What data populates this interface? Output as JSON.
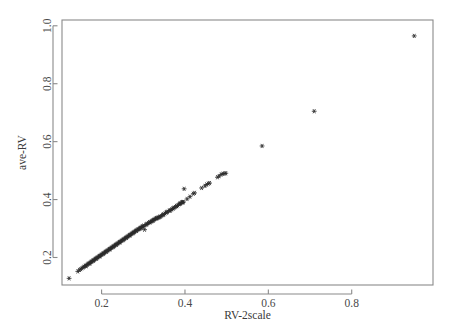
{
  "chart_data": {
    "type": "scatter",
    "title": "",
    "xlabel": "RV-2scale",
    "ylabel": "ave-RV",
    "xlim": [
      0.105,
      0.995
    ],
    "ylim": [
      0.105,
      1.02
    ],
    "xticks": [
      0.2,
      0.4,
      0.6,
      0.8
    ],
    "xtick_labels": [
      "0.2",
      "0.4",
      "0.6",
      "0.8"
    ],
    "yticks": [
      0.2,
      0.4,
      0.6,
      0.8,
      1.0
    ],
    "ytick_labels": [
      "0.2",
      "0.4",
      "0.6",
      "0.8",
      "1.0"
    ],
    "grid": false,
    "legend": null,
    "marker": "asterisk",
    "marker_color": "#2b2b2b",
    "points": [
      [
        0.122,
        0.128
      ],
      [
        0.143,
        0.152
      ],
      [
        0.147,
        0.157
      ],
      [
        0.15,
        0.16
      ],
      [
        0.153,
        0.163
      ],
      [
        0.156,
        0.166
      ],
      [
        0.158,
        0.168
      ],
      [
        0.161,
        0.171
      ],
      [
        0.163,
        0.173
      ],
      [
        0.166,
        0.176
      ],
      [
        0.168,
        0.178
      ],
      [
        0.17,
        0.18
      ],
      [
        0.173,
        0.183
      ],
      [
        0.175,
        0.185
      ],
      [
        0.177,
        0.187
      ],
      [
        0.179,
        0.189
      ],
      [
        0.181,
        0.191
      ],
      [
        0.183,
        0.193
      ],
      [
        0.185,
        0.195
      ],
      [
        0.187,
        0.197
      ],
      [
        0.189,
        0.199
      ],
      [
        0.191,
        0.201
      ],
      [
        0.193,
        0.203
      ],
      [
        0.195,
        0.205
      ],
      [
        0.197,
        0.207
      ],
      [
        0.199,
        0.209
      ],
      [
        0.201,
        0.211
      ],
      [
        0.203,
        0.213
      ],
      [
        0.205,
        0.215
      ],
      [
        0.207,
        0.217
      ],
      [
        0.209,
        0.219
      ],
      [
        0.211,
        0.221
      ],
      [
        0.213,
        0.223
      ],
      [
        0.215,
        0.225
      ],
      [
        0.217,
        0.227
      ],
      [
        0.219,
        0.229
      ],
      [
        0.221,
        0.231
      ],
      [
        0.223,
        0.233
      ],
      [
        0.225,
        0.235
      ],
      [
        0.227,
        0.237
      ],
      [
        0.229,
        0.239
      ],
      [
        0.231,
        0.241
      ],
      [
        0.233,
        0.243
      ],
      [
        0.235,
        0.245
      ],
      [
        0.237,
        0.247
      ],
      [
        0.239,
        0.249
      ],
      [
        0.241,
        0.251
      ],
      [
        0.243,
        0.253
      ],
      [
        0.245,
        0.255
      ],
      [
        0.247,
        0.257
      ],
      [
        0.249,
        0.259
      ],
      [
        0.251,
        0.261
      ],
      [
        0.253,
        0.263
      ],
      [
        0.255,
        0.265
      ],
      [
        0.257,
        0.267
      ],
      [
        0.259,
        0.269
      ],
      [
        0.261,
        0.271
      ],
      [
        0.263,
        0.273
      ],
      [
        0.265,
        0.275
      ],
      [
        0.267,
        0.277
      ],
      [
        0.269,
        0.279
      ],
      [
        0.271,
        0.281
      ],
      [
        0.273,
        0.283
      ],
      [
        0.275,
        0.285
      ],
      [
        0.277,
        0.287
      ],
      [
        0.279,
        0.289
      ],
      [
        0.281,
        0.291
      ],
      [
        0.283,
        0.293
      ],
      [
        0.285,
        0.295
      ],
      [
        0.287,
        0.297
      ],
      [
        0.289,
        0.298
      ],
      [
        0.291,
        0.3
      ],
      [
        0.293,
        0.302
      ],
      [
        0.295,
        0.304
      ],
      [
        0.297,
        0.306
      ],
      [
        0.299,
        0.308
      ],
      [
        0.301,
        0.31
      ],
      [
        0.303,
        0.296
      ],
      [
        0.306,
        0.313
      ],
      [
        0.309,
        0.316
      ],
      [
        0.312,
        0.319
      ],
      [
        0.315,
        0.322
      ],
      [
        0.318,
        0.323
      ],
      [
        0.32,
        0.325
      ],
      [
        0.322,
        0.327
      ],
      [
        0.324,
        0.329
      ],
      [
        0.326,
        0.331
      ],
      [
        0.328,
        0.333
      ],
      [
        0.33,
        0.334
      ],
      [
        0.332,
        0.336
      ],
      [
        0.334,
        0.337
      ],
      [
        0.336,
        0.338
      ],
      [
        0.338,
        0.339
      ],
      [
        0.34,
        0.34
      ],
      [
        0.343,
        0.343
      ],
      [
        0.346,
        0.346
      ],
      [
        0.349,
        0.349
      ],
      [
        0.352,
        0.352
      ],
      [
        0.355,
        0.355
      ],
      [
        0.358,
        0.358
      ],
      [
        0.362,
        0.361
      ],
      [
        0.365,
        0.363
      ],
      [
        0.368,
        0.366
      ],
      [
        0.371,
        0.369
      ],
      [
        0.374,
        0.372
      ],
      [
        0.377,
        0.374
      ],
      [
        0.38,
        0.377
      ],
      [
        0.383,
        0.38
      ],
      [
        0.386,
        0.384
      ],
      [
        0.388,
        0.386
      ],
      [
        0.39,
        0.388
      ],
      [
        0.392,
        0.39
      ],
      [
        0.394,
        0.391
      ],
      [
        0.396,
        0.392
      ],
      [
        0.163,
        0.17
      ],
      [
        0.172,
        0.179
      ],
      [
        0.18,
        0.188
      ],
      [
        0.188,
        0.196
      ],
      [
        0.196,
        0.204
      ],
      [
        0.204,
        0.212
      ],
      [
        0.212,
        0.22
      ],
      [
        0.22,
        0.228
      ],
      [
        0.228,
        0.236
      ],
      [
        0.236,
        0.244
      ],
      [
        0.244,
        0.252
      ],
      [
        0.252,
        0.26
      ],
      [
        0.26,
        0.268
      ],
      [
        0.268,
        0.276
      ],
      [
        0.276,
        0.284
      ],
      [
        0.284,
        0.292
      ],
      [
        0.292,
        0.299
      ],
      [
        0.3,
        0.307
      ],
      [
        0.308,
        0.314
      ],
      [
        0.316,
        0.321
      ],
      [
        0.324,
        0.328
      ],
      [
        0.332,
        0.335
      ],
      [
        0.34,
        0.341
      ],
      [
        0.348,
        0.348
      ],
      [
        0.356,
        0.356
      ],
      [
        0.364,
        0.362
      ],
      [
        0.372,
        0.37
      ],
      [
        0.38,
        0.378
      ],
      [
        0.388,
        0.385
      ],
      [
        0.395,
        0.39
      ],
      [
        0.398,
        0.437
      ],
      [
        0.405,
        0.402
      ],
      [
        0.412,
        0.41
      ],
      [
        0.42,
        0.42
      ],
      [
        0.423,
        0.423
      ],
      [
        0.44,
        0.44
      ],
      [
        0.448,
        0.447
      ],
      [
        0.452,
        0.452
      ],
      [
        0.456,
        0.455
      ],
      [
        0.459,
        0.457
      ],
      [
        0.478,
        0.477
      ],
      [
        0.482,
        0.481
      ],
      [
        0.487,
        0.487
      ],
      [
        0.491,
        0.489
      ],
      [
        0.495,
        0.49
      ],
      [
        0.498,
        0.491
      ],
      [
        0.585,
        0.585
      ],
      [
        0.71,
        0.705
      ],
      [
        0.95,
        0.965
      ]
    ]
  }
}
